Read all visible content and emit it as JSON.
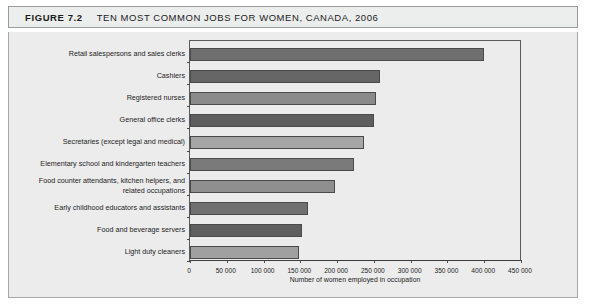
{
  "figure": {
    "number": "FIGURE 7.2",
    "title": "TEN MOST COMMON JOBS FOR WOMEN, CANADA, 2006"
  },
  "chart_data": {
    "type": "bar",
    "orientation": "horizontal",
    "title": "TEN MOST COMMON JOBS FOR WOMEN, CANADA, 2006",
    "xlabel": "Number of women employed in occupation",
    "ylabel": "",
    "xlim": [
      0,
      450000
    ],
    "grid": false,
    "legend": null,
    "xtick_labels": [
      "0",
      "50 000",
      "100 000",
      "150 000",
      "200 000",
      "250 000",
      "300 000",
      "350 000",
      "400 000",
      "450 000"
    ],
    "xtick_values": [
      0,
      50000,
      100000,
      150000,
      200000,
      250000,
      300000,
      350000,
      400000,
      450000
    ],
    "categories": [
      "Retail salespersons and sales clerks",
      "Cashiers",
      "Registered nurses",
      "General office clerks",
      "Secretaries (except legal and medical)",
      "Elementary school and kindergarten teachers",
      "Food counter attendants, kitchen helpers, and related occupations",
      "Early childhood educators and assistants",
      "Food and beverage servers",
      "Light duty cleaners"
    ],
    "values": [
      400000,
      258000,
      253000,
      250000,
      236000,
      223000,
      197000,
      160000,
      152000,
      148000
    ],
    "bar_colors": [
      "#6f6f6f",
      "#666666",
      "#8a8a8a",
      "#5e5e5e",
      "#a6a6a6",
      "#7a7a7a",
      "#8f8f8f",
      "#707070",
      "#5f5f5f",
      "#a0a0a0"
    ]
  }
}
